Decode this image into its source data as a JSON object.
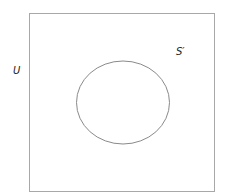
{
  "diagram": {
    "type": "venn",
    "universe_label": "U",
    "complement_label": "S′",
    "colors": {
      "stroke": "#9a9a9a",
      "background": "#ffffff",
      "text": "#222222"
    }
  }
}
